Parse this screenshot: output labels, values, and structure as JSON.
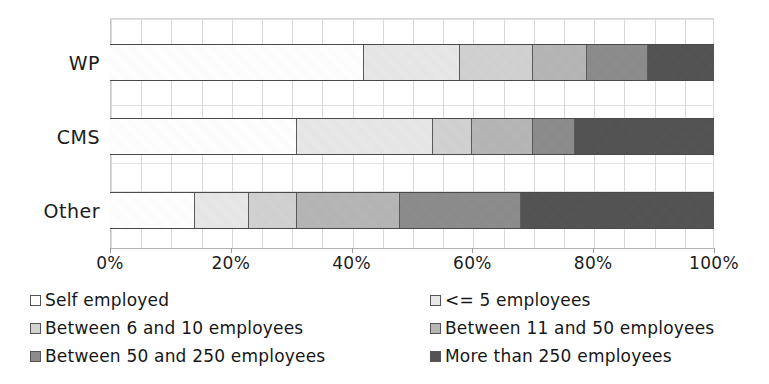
{
  "chart_data": {
    "type": "bar",
    "orientation": "horizontal",
    "stacked": true,
    "normalized": true,
    "title": "",
    "xlabel": "",
    "ylabel": "",
    "xlim": [
      0,
      100
    ],
    "grid": true,
    "legend_position": "bottom",
    "categories": [
      "WP",
      "CMS",
      "Other"
    ],
    "xticks": [
      0,
      20,
      40,
      60,
      80,
      100
    ],
    "xticklabels": [
      "0%",
      "20%",
      "40%",
      "60%",
      "80%",
      "100%"
    ],
    "series": [
      {
        "name": "Self employed",
        "color": "#ffffff",
        "values": [
          42,
          31,
          14
        ]
      },
      {
        "name": "<= 5 employees",
        "color": "#e8e8e8",
        "values": [
          16,
          22.5,
          9
        ]
      },
      {
        "name": "Between 6 and 10 employees",
        "color": "#d2d2d2",
        "values": [
          12,
          6.5,
          8
        ]
      },
      {
        "name": "Between 11 and 50 employees",
        "color": "#b6b6b6",
        "values": [
          9,
          10,
          17
        ]
      },
      {
        "name": "Between 50 and 250 employees",
        "color": "#8c8c8c",
        "values": [
          10,
          7,
          20
        ]
      },
      {
        "name": "More than 250 employees",
        "color": "#535353",
        "values": [
          11,
          23,
          32
        ]
      }
    ],
    "cumulative_boundaries": {
      "WP": [
        42,
        58,
        70,
        79,
        89,
        100
      ],
      "CMS": [
        31,
        53.5,
        60,
        70,
        77,
        100
      ],
      "Other": [
        14,
        23,
        31,
        48,
        68,
        100
      ]
    }
  },
  "axis": {
    "ticks": [
      {
        "label": "0%",
        "value": 0
      },
      {
        "label": "20%",
        "value": 20
      },
      {
        "label": "40%",
        "value": 40
      },
      {
        "label": "60%",
        "value": 60
      },
      {
        "label": "80%",
        "value": 80
      },
      {
        "label": "100%",
        "value": 100
      }
    ]
  },
  "legend": {
    "items": [
      {
        "label": "Self employed",
        "color": "#ffffff"
      },
      {
        "label": "<= 5 employees",
        "color": "#e8e8e8"
      },
      {
        "label": "Between 6 and 10 employees",
        "color": "#d2d2d2"
      },
      {
        "label": "Between 11 and 50 employees",
        "color": "#b6b6b6"
      },
      {
        "label": "Between 50 and 250 employees",
        "color": "#8c8c8c"
      },
      {
        "label": "More than 250 employees",
        "color": "#535353"
      }
    ]
  }
}
